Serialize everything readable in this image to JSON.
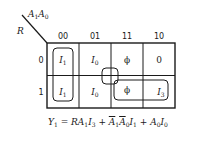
{
  "kmap": {
    "row_variable": "R",
    "col_variables": {
      "base1": "A",
      "sub1": "1",
      "base0": "A",
      "sub0": "0"
    },
    "col_labels": [
      "00",
      "01",
      "11",
      "10"
    ],
    "row_labels": [
      "0",
      "1"
    ],
    "cells": [
      [
        {
          "base": "I",
          "sub": "1"
        },
        {
          "base": "I",
          "sub": "0"
        },
        {
          "base": "ϕ",
          "sub": ""
        },
        {
          "base": "0",
          "sub": ""
        }
      ],
      [
        {
          "base": "I",
          "sub": "1"
        },
        {
          "base": "I",
          "sub": "0"
        },
        {
          "base": "ϕ",
          "sub": ""
        },
        {
          "base": "I",
          "sub": "3"
        }
      ]
    ],
    "groups": [
      "col-00 pair (I1)",
      "center quad (I0/ϕ)",
      "row-1 cols 11-10 (ϕ, I3)"
    ]
  },
  "equation": {
    "lhs": "Y",
    "lhs_sub": "1",
    "eq": " = ",
    "t1": "RA",
    "t1_s1": "1",
    "t1_b2": "I",
    "t1_s2": "3",
    "plus": " + ",
    "t2_a1": "A",
    "t2_s1": "1",
    "t2_a0": "A",
    "t2_s0": "0",
    "t2_i": "I",
    "t2_si": "1",
    "t3_a": "A",
    "t3_sa": "0",
    "t3_i": "I",
    "t3_si": "0"
  }
}
